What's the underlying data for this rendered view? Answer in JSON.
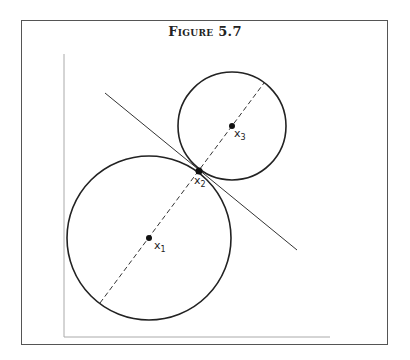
{
  "figure": {
    "title": "Figure 5.7"
  },
  "diagram": {
    "axes": {
      "x_axis": "horizontal",
      "y_axis": "vertical"
    },
    "circles": [
      {
        "name": "large-circle",
        "cx": 149,
        "cy": 238,
        "r": 82
      },
      {
        "name": "small-circle",
        "cx": 232,
        "cy": 126,
        "r": 54
      }
    ],
    "points": [
      {
        "label": "x",
        "sub": "1",
        "cx": 149,
        "cy": 238
      },
      {
        "label": "x",
        "sub": "2",
        "cx": 199,
        "cy": 171
      },
      {
        "label": "x",
        "sub": "3",
        "cx": 232,
        "cy": 126
      }
    ],
    "lines": {
      "tangent": {
        "x1": 105,
        "y1": 93,
        "x2": 297,
        "y2": 250,
        "style": "solid"
      },
      "center_line": {
        "x1": 100,
        "y1": 303,
        "x2": 264,
        "y2": 83,
        "style": "dashed"
      }
    }
  },
  "labels": {
    "x1": "x",
    "x1_sub": "1",
    "x2": "x",
    "x2_sub": "2",
    "x3": "x",
    "x3_sub": "3"
  }
}
